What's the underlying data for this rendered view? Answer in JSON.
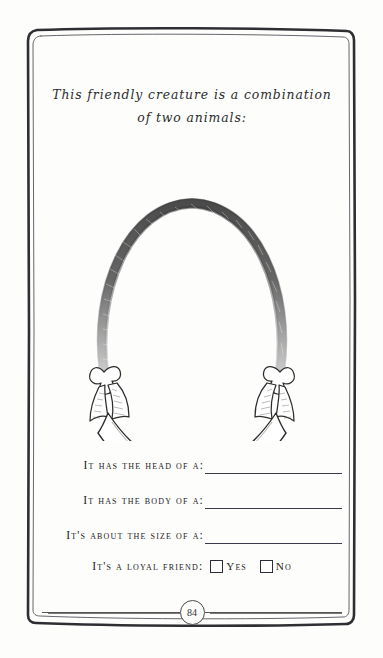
{
  "page": {
    "background_color": "#fdfdfc",
    "ink_color": "#222222",
    "border_color": "#2f2f33"
  },
  "title": {
    "line1": "This friendly creature is a combination",
    "line2": "of two animals:"
  },
  "illustration": {
    "name": "oval-garland-frame-with-banner",
    "description": "Hand-drawn open oval wreath with ribbon bows at each lower end supporting a blank curved banner",
    "banner_text": ""
  },
  "prompts": [
    {
      "label": "It has the head of a:",
      "value": ""
    },
    {
      "label": "It has the body of a:",
      "value": ""
    },
    {
      "label": "It's about the size of a:",
      "value": ""
    }
  ],
  "loyal_friend": {
    "label": "It's a loyal friend:",
    "options": [
      {
        "label": "Yes",
        "checked": false
      },
      {
        "label": "No",
        "checked": false
      }
    ]
  },
  "footer": {
    "page_number": "84"
  }
}
